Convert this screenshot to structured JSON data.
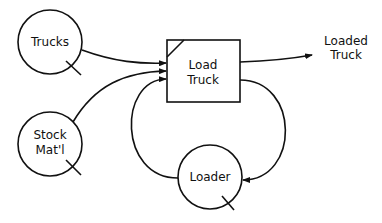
{
  "diagram": {
    "type": "activity-cycle-diagram",
    "nodes": {
      "trucks": {
        "label": "Trucks",
        "kind": "queue"
      },
      "stock": {
        "line1": "Stock",
        "line2": "Mat'l",
        "kind": "queue"
      },
      "loader": {
        "label": "Loader",
        "kind": "queue"
      },
      "load_truck": {
        "line1": "Load",
        "line2": "Truck",
        "kind": "activity"
      }
    },
    "output": {
      "line1": "Loaded",
      "line2": "Truck"
    },
    "edges": [
      {
        "from": "Trucks",
        "to": "Load Truck"
      },
      {
        "from": "Stock Mat'l",
        "to": "Load Truck"
      },
      {
        "from": "Loader",
        "to": "Load Truck"
      },
      {
        "from": "Load Truck",
        "to": "Loader"
      },
      {
        "from": "Load Truck",
        "to": "Loaded Truck"
      }
    ],
    "stroke_color": "#111111",
    "background": "#ffffff"
  }
}
